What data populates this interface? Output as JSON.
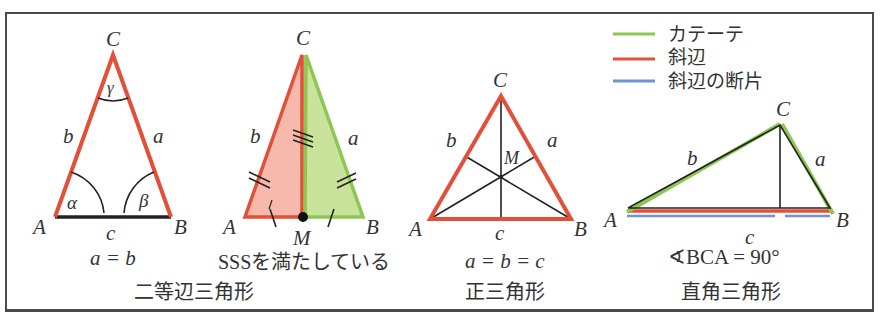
{
  "colors": {
    "hypotenuse": "#e2503a",
    "cathetus": "#8cc751",
    "segment": "#6f95cf",
    "ink": "#222222",
    "fill_red": "#f6b9ab",
    "fill_green": "#c9e29c"
  },
  "legend": {
    "items": [
      {
        "label": "カテーテ",
        "color": "#8cc751"
      },
      {
        "label": "斜辺",
        "color": "#e2503a"
      },
      {
        "label": "斜辺の断片",
        "color": "#6f95cf"
      }
    ]
  },
  "isosceles": {
    "vertices": {
      "A": "A",
      "B": "B",
      "C": "C"
    },
    "sides": {
      "a": "a",
      "b": "b",
      "c": "c"
    },
    "angles": {
      "alpha": "α",
      "beta": "β",
      "gamma": "γ"
    },
    "relation": "a = b",
    "title": "二等辺三角形"
  },
  "sss": {
    "vertices": {
      "A": "A",
      "B": "B",
      "C": "C",
      "M": "M"
    },
    "sides": {
      "a": "a",
      "b": "b"
    },
    "caption": "SSSを満たしている"
  },
  "equilateral": {
    "vertices": {
      "A": "A",
      "B": "B",
      "C": "C",
      "M": "M"
    },
    "sides": {
      "a": "a",
      "b": "b",
      "c": "c"
    },
    "relation": "a = b = c",
    "title": "正三角形"
  },
  "right": {
    "vertices": {
      "A": "A",
      "B": "B",
      "C": "C"
    },
    "sides": {
      "a": "a",
      "b": "b",
      "c": "c"
    },
    "relation": "∢BCA = 90°",
    "title": "直角三角形"
  }
}
